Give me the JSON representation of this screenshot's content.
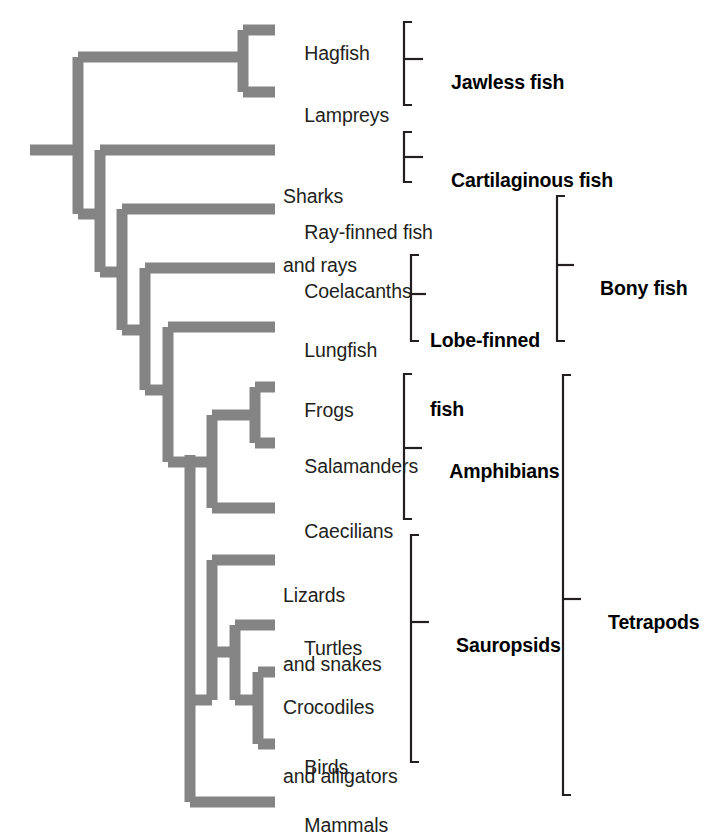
{
  "figure": {
    "type": "cladogram",
    "branch_color": "#848484",
    "bracket_color": "#231f20",
    "text_color": "#231f20",
    "background": "#ffffff"
  },
  "tips": [
    {
      "id": "hagfish",
      "label": "Hagfish",
      "label2": "",
      "y": 30
    },
    {
      "id": "lampreys",
      "label": "Lampreys",
      "label2": "",
      "y": 92
    },
    {
      "id": "sharks",
      "label": "Sharks",
      "label2": "and rays",
      "y": 150
    },
    {
      "id": "rayfinned",
      "label": "Ray-finned fish",
      "label2": "",
      "y": 209
    },
    {
      "id": "coelacanth",
      "label": "Coelacanths",
      "label2": "",
      "y": 268
    },
    {
      "id": "lungfish",
      "label": "Lungfish",
      "label2": "",
      "y": 327
    },
    {
      "id": "frogs",
      "label": "Frogs",
      "label2": "",
      "y": 387
    },
    {
      "id": "salamander",
      "label": "Salamanders",
      "label2": "",
      "y": 443
    },
    {
      "id": "caecilians",
      "label": "Caecilians",
      "label2": "",
      "y": 508
    },
    {
      "id": "lizards",
      "label": "Lizards",
      "label2": "and snakes",
      "y": 560
    },
    {
      "id": "turtles",
      "label": "Turtles",
      "label2": "",
      "y": 625
    },
    {
      "id": "crocodiles",
      "label": "Crocodiles",
      "label2": "and alligators",
      "y": 672
    },
    {
      "id": "birds",
      "label": "Birds",
      "label2": "",
      "y": 744
    },
    {
      "id": "mammals",
      "label": "Mammals",
      "label2": "",
      "y": 802
    }
  ],
  "clades": [
    {
      "id": "jawless",
      "label": "Jawless fish",
      "label2": "",
      "top": 22,
      "bottom": 105,
      "bracket_x": 404,
      "label_x": 430,
      "label_y": 59
    },
    {
      "id": "cartilaginous",
      "label": "Cartilaginous fish",
      "label2": "",
      "top": 132,
      "bottom": 182,
      "bracket_x": 404,
      "label_x": 430,
      "label_y": 157
    },
    {
      "id": "lobefinned",
      "label": "Lobe-finned",
      "label2": "fish",
      "top": 255,
      "bottom": 341,
      "bracket_x": 411,
      "label_x": 430,
      "label_y": 288
    },
    {
      "id": "bonyfish",
      "label": "Bony fish",
      "label2": "",
      "top": 196,
      "bottom": 341,
      "bracket_x": 557,
      "label_x": 579,
      "label_y": 265
    },
    {
      "id": "amphibians",
      "label": "Amphibians",
      "label2": "",
      "top": 374,
      "bottom": 519,
      "bracket_x": 404,
      "label_x": 429,
      "label_y": 448
    },
    {
      "id": "sauropsids",
      "label": "Sauropsids",
      "label2": "",
      "top": 535,
      "bottom": 762,
      "bracket_x": 411,
      "label_x": 435,
      "label_y": 622
    },
    {
      "id": "tetrapods",
      "label": "Tetrapods",
      "label2": "",
      "top": 375,
      "bottom": 795,
      "bracket_x": 563,
      "label_x": 587,
      "label_y": 599
    }
  ],
  "branch_geometry": {
    "stroke_width": 11,
    "root_stub_x1": 30,
    "root_stub_x2": 78,
    "root_y": 150,
    "tip_x": 275,
    "nodes": [
      {
        "id": "vertebrata",
        "x": 78,
        "child_top_y": 62,
        "child_bottom_y": 214
      },
      {
        "id": "jawless-mrca",
        "x": 243,
        "child_top_y": 30,
        "child_bottom_y": 92
      },
      {
        "id": "gnathostome",
        "x": 100,
        "child_top_y": 150,
        "child_bottom_y": 272
      },
      {
        "id": "osteichthyes",
        "x": 122,
        "child_top_y": 209,
        "child_bottom_y": 330
      },
      {
        "id": "sarcopterygii",
        "x": 145,
        "child_top_y": 268,
        "child_bottom_y": 390
      },
      {
        "id": "rhipidistia",
        "x": 168,
        "child_top_y": 327,
        "child_bottom_y": 450
      },
      {
        "id": "tetrapoda",
        "x": 190,
        "child_top_y": 462,
        "child_bottom_y": 802
      },
      {
        "id": "amphibia",
        "x": 212,
        "child_top_y": 415,
        "child_bottom_y": 508
      },
      {
        "id": "batrachia",
        "x": 255,
        "child_top_y": 387,
        "child_bottom_y": 443
      },
      {
        "id": "amniota",
        "x": 212,
        "child_top_y": 560,
        "child_bottom_y": 744
      },
      {
        "id": "sauropsida",
        "x": 235,
        "child_top_y": 625,
        "child_bottom_y": 716
      },
      {
        "id": "archosauria",
        "x": 258,
        "child_top_y": 672,
        "child_bottom_y": 744
      }
    ]
  }
}
